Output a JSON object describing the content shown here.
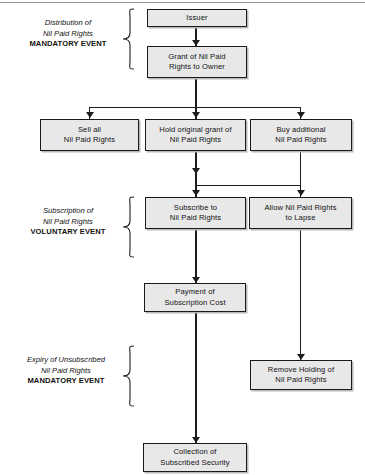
{
  "diagram": {
    "colors": {
      "node_fill": "#e8e8e8",
      "node_border": "#1a1a1a",
      "connector": "#1d1d1d",
      "text": "#111111",
      "shadow": "#b9b9b9",
      "background": "#ffffff"
    },
    "sections": [
      {
        "id": "distribution",
        "line1": "Distribution of",
        "line2": "Nil Paid Rights",
        "line3": "MANDATORY EVENT"
      },
      {
        "id": "subscription",
        "line1": "Subscription of",
        "line2": "Nil Paid Rights",
        "line3": "VOLUNTARY EVENT"
      },
      {
        "id": "expiry",
        "line1": "Expiry of Unsubscribed",
        "line2": "Nil Paid Rights",
        "line3": "MANDATORY EVENT"
      }
    ],
    "nodes": [
      {
        "id": "issuer",
        "label": "Issuer"
      },
      {
        "id": "grant",
        "label": "Grant of Nil Paid\nRights to Owner"
      },
      {
        "id": "sell-all",
        "label": "Sell all\nNil Paid Rights"
      },
      {
        "id": "hold-original",
        "label": "Hold original grant of\nNil Paid Rights"
      },
      {
        "id": "buy-additional",
        "label": "Buy additional\nNil Paid Rights"
      },
      {
        "id": "subscribe",
        "label": "Subscribe to\nNil Paid Rights"
      },
      {
        "id": "allow-lapse",
        "label": "Allow Nil Paid Rights\nto Lapse"
      },
      {
        "id": "payment",
        "label": "Payment of\nSubscription Cost"
      },
      {
        "id": "remove-holding",
        "label": "Remove Holding of\nNil Paid Rights"
      },
      {
        "id": "collection",
        "label": "Collection of\nSubscribed Security"
      }
    ]
  }
}
